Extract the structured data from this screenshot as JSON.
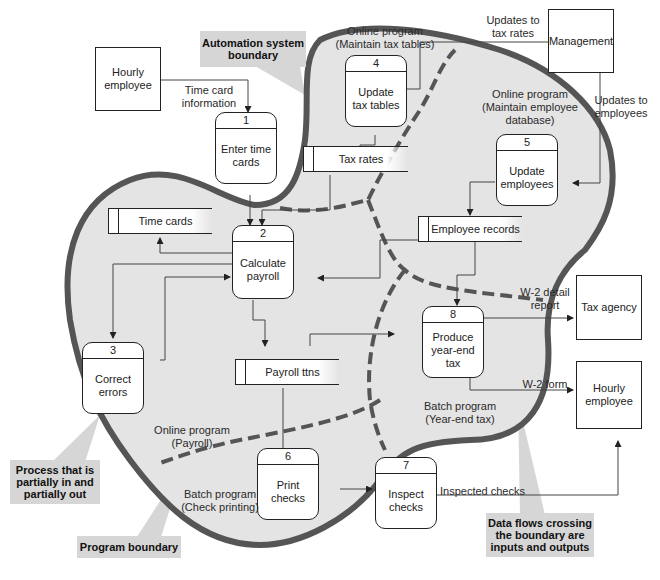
{
  "diagram": {
    "type": "data-flow-diagram",
    "colors": {
      "boundary": "#555555",
      "fill": "#e4e4e4",
      "callout": "#d6d6d6",
      "line": "#222222"
    }
  },
  "callouts": {
    "automation_boundary": "Automation system boundary",
    "partial_process": "Process that is partially in and partially out",
    "program_boundary": "Program boundary",
    "data_flows": "Data flows crossing the boundary are inputs and outputs"
  },
  "entities": {
    "hourly_employee_in": "Hourly employee",
    "management": "Management",
    "tax_agency": "Tax agency",
    "hourly_employee_out": "Hourly employee"
  },
  "processes": [
    {
      "num": "1",
      "name": "Enter time cards"
    },
    {
      "num": "2",
      "name": "Calculate payroll"
    },
    {
      "num": "3",
      "name": "Correct errors"
    },
    {
      "num": "4",
      "name": "Update tax tables"
    },
    {
      "num": "5",
      "name": "Update employees"
    },
    {
      "num": "6",
      "name": "Print checks"
    },
    {
      "num": "7",
      "name": "Inspect checks"
    },
    {
      "num": "8",
      "name": "Produce year-end tax"
    }
  ],
  "stores": {
    "tax_rates": "Tax rates",
    "time_cards": "Time cards",
    "employee_records": "Employee records",
    "payroll_ttns": "Payroll ttns"
  },
  "flows": {
    "time_card_info": "Time card information",
    "updates_tax_rates": "Updates to tax rates",
    "updates_employees": "Updates to employees",
    "w2_detail": "W-2 detail report",
    "w2_form": "W-2 form",
    "inspected_checks": "Inspected checks"
  },
  "programs": {
    "maintain_tax": "Online program (Maintain tax tables)",
    "maintain_emp": "Online program (Maintain employee database)",
    "payroll": "Online program (Payroll)",
    "check_printing": "Batch program (Check printing)",
    "year_end": "Batch program (Year-end tax)"
  }
}
